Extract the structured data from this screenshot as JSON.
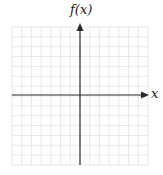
{
  "diagram": {
    "type": "coordinate-grid",
    "y_axis_label": "f(x)",
    "x_axis_label": "x",
    "grid": {
      "columns": 14,
      "rows": 14,
      "cell_px": 9.7
    },
    "colors": {
      "axis": "#2a2a2a",
      "grid": "#e2e2e2",
      "background": "#ffffff"
    }
  }
}
